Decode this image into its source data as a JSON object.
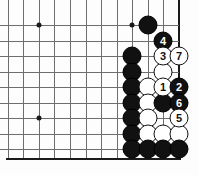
{
  "diagram": {
    "kind": "go-board-diagram",
    "grid": {
      "columns_x": [
        8,
        23,
        39,
        54,
        70,
        86,
        101,
        117,
        132,
        148,
        163,
        179
      ],
      "rows_y": [
        25,
        41,
        56,
        72,
        87,
        103,
        118,
        134,
        149
      ],
      "spacing": 15.5,
      "line_color": "#6d6d6d",
      "edge_color": "#1a1a1a",
      "right_edge_x": 179,
      "bottom_edge_y": 158,
      "top_open": true,
      "left_open": true
    },
    "star_points": [
      {
        "x": 39,
        "y": 25
      },
      {
        "x": 132,
        "y": 25
      },
      {
        "x": 39,
        "y": 118
      }
    ],
    "stones": [
      {
        "x": 148,
        "y": 25,
        "color": "black",
        "label": ""
      },
      {
        "x": 163,
        "y": 41,
        "color": "black",
        "label": "4"
      },
      {
        "x": 132,
        "y": 56,
        "color": "black",
        "label": ""
      },
      {
        "x": 163,
        "y": 56,
        "color": "white",
        "label": "3"
      },
      {
        "x": 179,
        "y": 56,
        "color": "white",
        "label": "7"
      },
      {
        "x": 132,
        "y": 72,
        "color": "black",
        "label": ""
      },
      {
        "x": 163,
        "y": 72,
        "color": "white",
        "label": ""
      },
      {
        "x": 132,
        "y": 87,
        "color": "black",
        "label": ""
      },
      {
        "x": 148,
        "y": 87,
        "color": "white",
        "label": ""
      },
      {
        "x": 163,
        "y": 87,
        "color": "white",
        "label": "1"
      },
      {
        "x": 179,
        "y": 87,
        "color": "black",
        "label": "2"
      },
      {
        "x": 132,
        "y": 103,
        "color": "black",
        "label": ""
      },
      {
        "x": 148,
        "y": 103,
        "color": "white",
        "label": ""
      },
      {
        "x": 163,
        "y": 103,
        "color": "black",
        "label": ""
      },
      {
        "x": 179,
        "y": 103,
        "color": "black",
        "label": "6"
      },
      {
        "x": 132,
        "y": 118,
        "color": "black",
        "label": ""
      },
      {
        "x": 148,
        "y": 118,
        "color": "white",
        "label": ""
      },
      {
        "x": 179,
        "y": 118,
        "color": "white",
        "label": "5"
      },
      {
        "x": 132,
        "y": 134,
        "color": "black",
        "label": ""
      },
      {
        "x": 148,
        "y": 134,
        "color": "white",
        "label": ""
      },
      {
        "x": 163,
        "y": 134,
        "color": "white",
        "label": ""
      },
      {
        "x": 179,
        "y": 134,
        "color": "white",
        "label": ""
      },
      {
        "x": 132,
        "y": 149,
        "color": "black",
        "label": ""
      },
      {
        "x": 148,
        "y": 149,
        "color": "black",
        "label": ""
      },
      {
        "x": 163,
        "y": 149,
        "color": "black",
        "label": ""
      },
      {
        "x": 179,
        "y": 149,
        "color": "black",
        "label": ""
      }
    ],
    "move_sequence": [
      {
        "number": "1",
        "color": "white"
      },
      {
        "number": "2",
        "color": "black"
      },
      {
        "number": "3",
        "color": "white"
      },
      {
        "number": "4",
        "color": "black"
      },
      {
        "number": "5",
        "color": "white"
      },
      {
        "number": "6",
        "color": "black"
      },
      {
        "number": "7",
        "color": "white"
      }
    ]
  }
}
